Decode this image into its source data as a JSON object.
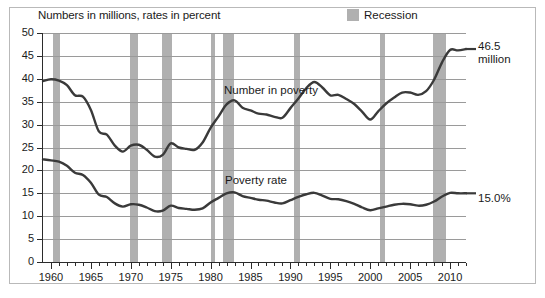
{
  "figure": {
    "subtitle": "Numbers in millions, rates in percent",
    "legend": {
      "label": "Recession",
      "swatch_color": "#b0b0b0"
    },
    "end_labels": {
      "number_line1": "46.5",
      "number_line2": "million",
      "rate": "15.0%"
    },
    "series_labels": {
      "number": "Number in poverty",
      "rate": "Poverty rate"
    }
  },
  "chart_data": {
    "type": "line",
    "title": "",
    "subtitle": "Numbers in millions, rates in percent",
    "xlabel": "",
    "ylabel": "",
    "xlim": [
      1959,
      2012
    ],
    "ylim": [
      0,
      50
    ],
    "grid": true,
    "legend_position": "top-right",
    "yticks": [
      0,
      5,
      10,
      15,
      20,
      25,
      30,
      35,
      40,
      45,
      50
    ],
    "ytick_labels": [
      "0",
      "5",
      "10",
      "15",
      "20",
      "25",
      "30",
      "35",
      "40",
      "45",
      "50"
    ],
    "xticks_major": [
      1960,
      1965,
      1970,
      1975,
      1980,
      1985,
      1990,
      1995,
      2000,
      2005,
      2010
    ],
    "xtick_labels": [
      "1960",
      "1965",
      "1970",
      "1975",
      "1980",
      "1985",
      "1990",
      "1995",
      "2000",
      "2005",
      "2010"
    ],
    "x": [
      1959,
      1960,
      1961,
      1962,
      1963,
      1964,
      1965,
      1966,
      1967,
      1968,
      1969,
      1970,
      1971,
      1972,
      1973,
      1974,
      1975,
      1976,
      1977,
      1978,
      1979,
      1980,
      1981,
      1982,
      1983,
      1984,
      1985,
      1986,
      1987,
      1988,
      1989,
      1990,
      1991,
      1992,
      1993,
      1994,
      1995,
      1996,
      1997,
      1998,
      1999,
      2000,
      2001,
      2002,
      2003,
      2004,
      2005,
      2006,
      2007,
      2008,
      2009,
      2010,
      2011,
      2012
    ],
    "series": [
      {
        "name": "Number in poverty",
        "units": "millions",
        "color": "#3a3a3a",
        "end_value": 46.5,
        "end_label": "46.5 million",
        "values": [
          39.5,
          39.9,
          39.6,
          38.6,
          36.4,
          36.1,
          33.2,
          28.5,
          27.8,
          25.4,
          24.1,
          25.4,
          25.6,
          24.5,
          23.0,
          23.4,
          25.9,
          25.0,
          24.7,
          24.5,
          26.1,
          29.3,
          31.8,
          34.4,
          35.3,
          33.7,
          33.1,
          32.4,
          32.2,
          31.7,
          31.5,
          33.6,
          35.7,
          38.0,
          39.3,
          38.1,
          36.4,
          36.5,
          35.6,
          34.5,
          32.8,
          31.1,
          32.9,
          34.6,
          35.9,
          37.0,
          37.0,
          36.5,
          37.3,
          39.8,
          43.6,
          46.3,
          46.2,
          46.5
        ]
      },
      {
        "name": "Poverty rate",
        "units": "percent",
        "color": "#3a3a3a",
        "end_value": 15.0,
        "end_label": "15.0%",
        "values": [
          22.4,
          22.2,
          21.9,
          21.0,
          19.5,
          19.0,
          17.3,
          14.7,
          14.2,
          12.8,
          12.1,
          12.6,
          12.5,
          11.9,
          11.1,
          11.2,
          12.3,
          11.8,
          11.6,
          11.4,
          11.7,
          13.0,
          14.0,
          15.0,
          15.2,
          14.4,
          14.0,
          13.6,
          13.4,
          13.0,
          12.8,
          13.5,
          14.2,
          14.8,
          15.1,
          14.5,
          13.8,
          13.7,
          13.3,
          12.7,
          11.9,
          11.3,
          11.7,
          12.1,
          12.5,
          12.7,
          12.6,
          12.3,
          12.5,
          13.2,
          14.3,
          15.1,
          15.0,
          15.0
        ]
      }
    ],
    "recessions": [
      {
        "start": 1960.3,
        "end": 1961.1
      },
      {
        "start": 1969.9,
        "end": 1970.9
      },
      {
        "start": 1973.9,
        "end": 1975.2
      },
      {
        "start": 1980.1,
        "end": 1980.5
      },
      {
        "start": 1981.5,
        "end": 1982.9
      },
      {
        "start": 1990.5,
        "end": 1991.2
      },
      {
        "start": 2001.2,
        "end": 2001.9
      },
      {
        "start": 2007.9,
        "end": 2009.5
      }
    ]
  }
}
